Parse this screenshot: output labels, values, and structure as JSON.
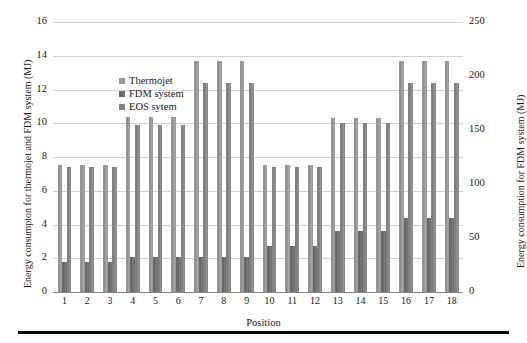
{
  "chart_data": {
    "type": "bar",
    "title": "",
    "xlabel": "Position",
    "ylabel": "Energy consumpton for thermojet and FDM system (MJ)",
    "y2label": "Energy consumption for FDM system (MJ)",
    "categories": [
      "1",
      "2",
      "3",
      "4",
      "5",
      "6",
      "7",
      "8",
      "9",
      "10",
      "11",
      "12",
      "13",
      "14",
      "15",
      "16",
      "17",
      "18"
    ],
    "series": [
      {
        "name": "Thermojet",
        "axis": "left",
        "color": "#9a9a9a",
        "values": [
          7.5,
          7.5,
          7.5,
          10.4,
          10.4,
          10.4,
          13.7,
          13.7,
          13.7,
          7.5,
          7.5,
          7.5,
          10.3,
          10.3,
          10.3,
          13.7,
          13.7,
          13.7
        ]
      },
      {
        "name": "FDM system",
        "axis": "right",
        "color": "#6a6a6a",
        "values": [
          1.8,
          1.8,
          1.8,
          2.1,
          2.1,
          2.1,
          2.1,
          2.1,
          2.1,
          2.7,
          2.7,
          2.7,
          3.6,
          3.6,
          3.6,
          4.4,
          4.4,
          4.4
        ],
        "values_right_scale": [
          28,
          28,
          28,
          33,
          33,
          33,
          33,
          33,
          33,
          42,
          42,
          42,
          56,
          56,
          56,
          69,
          69,
          69
        ]
      },
      {
        "name": "EOS sytem",
        "axis": "left",
        "color": "#828282",
        "values": [
          7.4,
          7.4,
          7.4,
          9.9,
          9.9,
          9.9,
          12.4,
          12.4,
          12.4,
          7.4,
          7.4,
          7.4,
          10.0,
          10.0,
          10.0,
          12.4,
          12.4,
          12.4
        ]
      }
    ],
    "ylim": [
      0,
      16
    ],
    "yticks": [
      "0",
      "2",
      "4",
      "6",
      "8",
      "10",
      "12",
      "14",
      "16"
    ],
    "y2lim": [
      0,
      250
    ],
    "y2ticks": [
      "0",
      "50",
      "100",
      "150",
      "200",
      "250"
    ],
    "grid": true,
    "legend_position": "upper-left-inside"
  },
  "legend": {
    "items": [
      {
        "label": "Thermojet"
      },
      {
        "label": "FDM system"
      },
      {
        "label": "EOS sytem"
      }
    ]
  },
  "axes": {
    "x_title": "Position",
    "y_left_title": "Energy consumpton for thermojet and FDM system (MJ)",
    "y_right_title": "Energy consumption for FDM system (MJ)"
  }
}
